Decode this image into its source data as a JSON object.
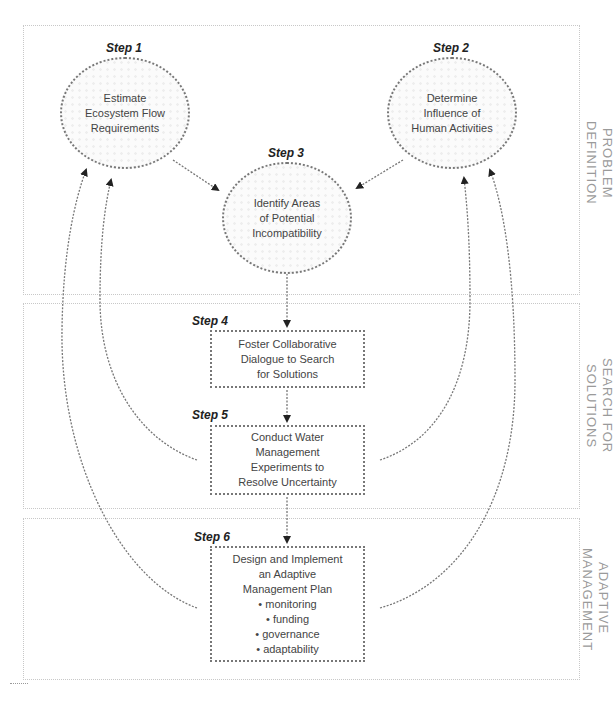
{
  "sections": [
    {
      "id": "problem-definition",
      "label": "PROBLEM DEFINITION"
    },
    {
      "id": "search-for-solutions",
      "label": "SEARCH FOR SOLUTIONS"
    },
    {
      "id": "adaptive-management",
      "label": "ADAPTIVE\nMANAGEMENT"
    }
  ],
  "steps": [
    {
      "step": "Step 1",
      "shape": "ellipse",
      "lines": [
        "Estimate",
        "Ecosystem Flow",
        "Requirements"
      ]
    },
    {
      "step": "Step 2",
      "shape": "ellipse",
      "lines": [
        "Determine",
        "Influence of",
        "Human Activities"
      ]
    },
    {
      "step": "Step 3",
      "shape": "ellipse",
      "lines": [
        "Identify Areas",
        "of Potential",
        "Incompatibility"
      ]
    },
    {
      "step": "Step 4",
      "shape": "box",
      "lines": [
        "Foster Collaborative",
        "Dialogue to Search",
        "for Solutions"
      ]
    },
    {
      "step": "Step 5",
      "shape": "box",
      "lines": [
        "Conduct Water",
        "Management",
        "Experiments to",
        "Resolve Uncertainty"
      ]
    },
    {
      "step": "Step 6",
      "shape": "box",
      "lines": [
        "Design and Implement",
        "an Adaptive",
        "Management Plan",
        "• monitoring",
        "• funding",
        "• governance",
        "• adaptability"
      ]
    }
  ],
  "connections": [
    {
      "from": "Step 1",
      "to": "Step 3"
    },
    {
      "from": "Step 2",
      "to": "Step 3"
    },
    {
      "from": "Step 3",
      "to": "Step 4"
    },
    {
      "from": "Step 4",
      "to": "Step 5"
    },
    {
      "from": "Step 5",
      "to": "Step 6"
    },
    {
      "from": "Step 5",
      "to": "Step 1",
      "type": "feedback"
    },
    {
      "from": "Step 5",
      "to": "Step 2",
      "type": "feedback"
    },
    {
      "from": "Step 6",
      "to": "Step 1",
      "type": "feedback"
    },
    {
      "from": "Step 6",
      "to": "Step 2",
      "type": "feedback"
    }
  ]
}
